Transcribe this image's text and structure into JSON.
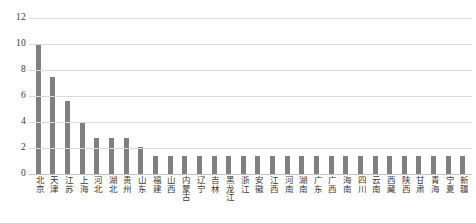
{
  "chart_data": {
    "type": "bar",
    "title": "",
    "subtitle": "",
    "xlabel": "",
    "ylabel": "",
    "ylim": [
      0,
      12
    ],
    "yticks": [
      0,
      2,
      4,
      6,
      8,
      10,
      12
    ],
    "grid": true,
    "legend": false,
    "legend_position": "none",
    "bar_color": "#808080",
    "gridline_color": "#d9d9d9",
    "categories": [
      "北京",
      "天津",
      "江苏",
      "上海",
      "河北",
      "湖北",
      "贵州",
      "山东",
      "福建",
      "山西",
      "内蒙古",
      "辽宁",
      "吉林",
      "黑龙江",
      "浙江",
      "安徽",
      "江西",
      "河南",
      "湖南",
      "广东",
      "广西",
      "海南",
      "四川",
      "云南",
      "西藏",
      "陕西",
      "甘肃",
      "青海",
      "宁夏",
      "新疆"
    ],
    "values": [
      10.0,
      7.5,
      5.6,
      4.0,
      2.8,
      2.8,
      2.8,
      2.1,
      1.4,
      1.4,
      1.4,
      1.4,
      1.4,
      1.4,
      1.4,
      1.4,
      1.4,
      1.4,
      1.4,
      1.4,
      1.4,
      1.4,
      1.4,
      1.4,
      1.4,
      1.4,
      1.4,
      1.4,
      1.4,
      1.4
    ]
  }
}
